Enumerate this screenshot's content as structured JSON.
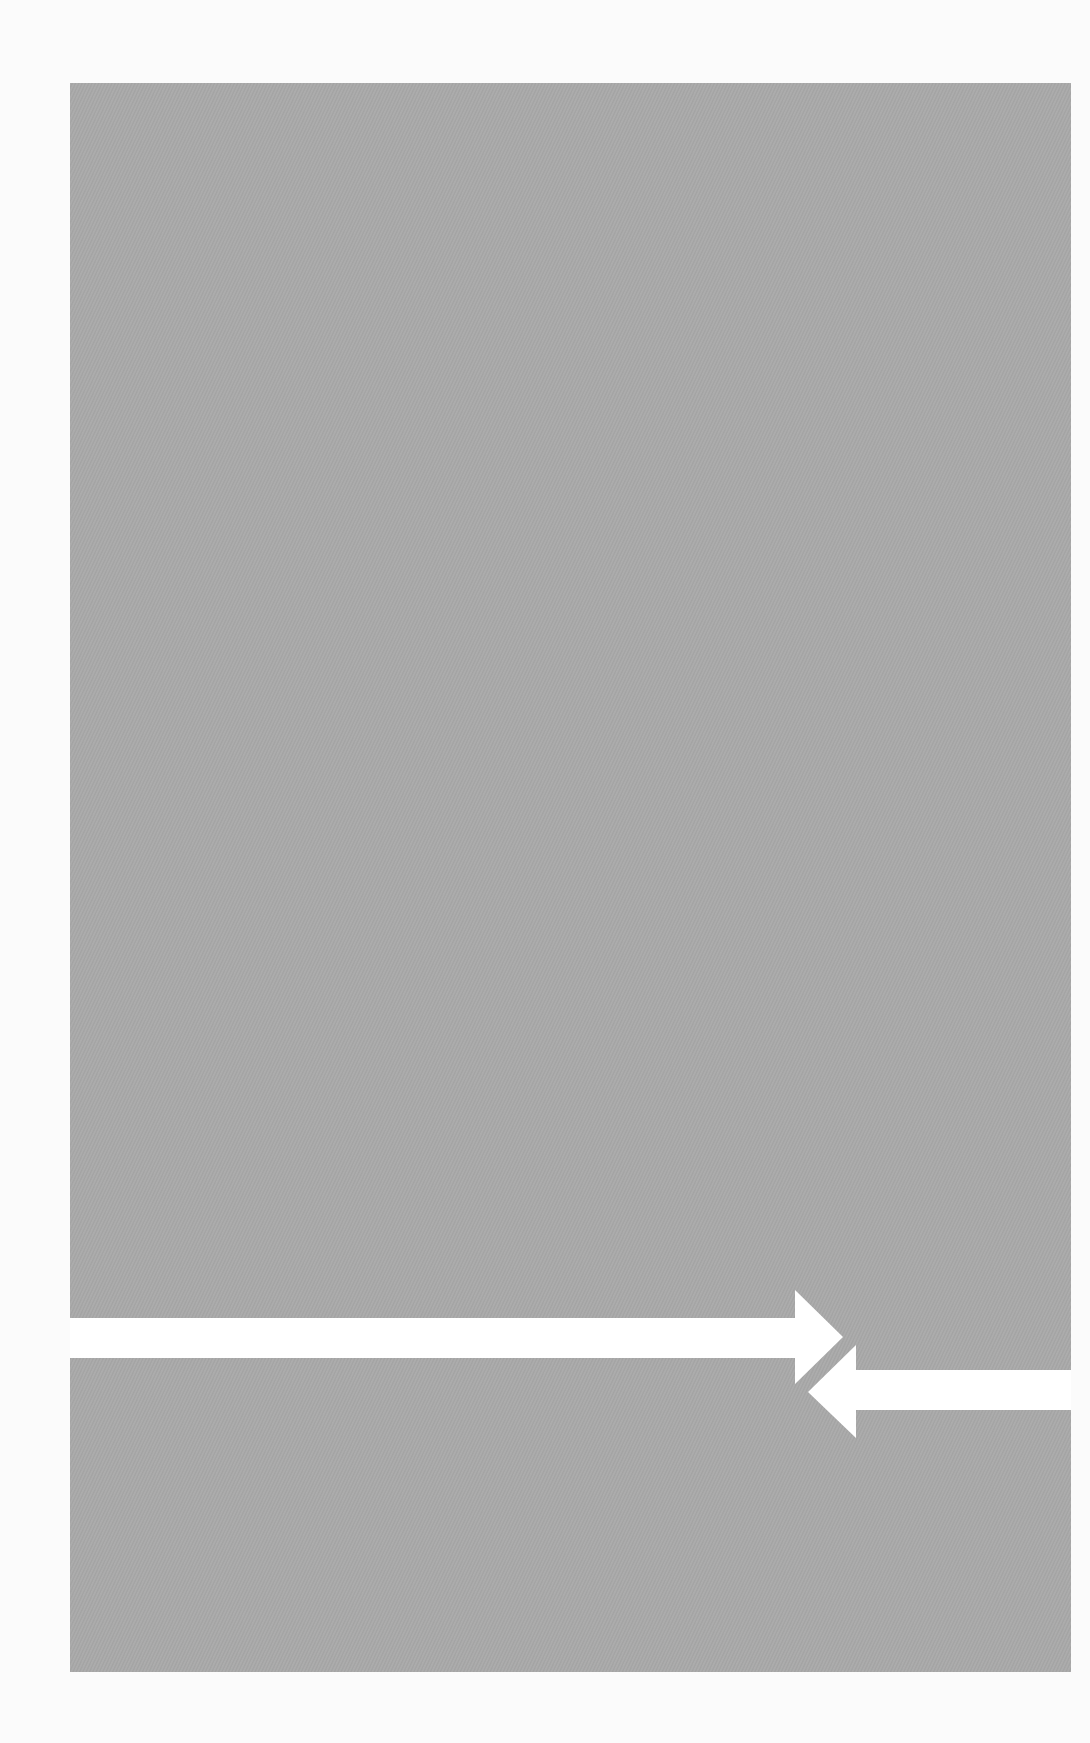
{
  "image": {
    "description": "Gray textured panel crossed by two opposing white arrows",
    "background_color": "#fbfbfb",
    "panel_color": "#a8a8a8",
    "arrow_color": "#ffffff"
  },
  "arrows": [
    {
      "name": "right-pointing-arrow",
      "direction": "right"
    },
    {
      "name": "left-pointing-arrow",
      "direction": "left"
    }
  ]
}
